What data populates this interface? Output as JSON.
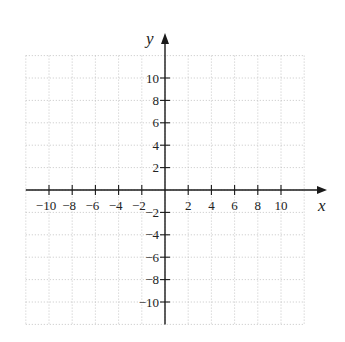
{
  "chart_data": {
    "type": "scatter",
    "title": "",
    "xlabel": "x",
    "ylabel": "y",
    "xlim": [
      -12,
      12
    ],
    "ylim": [
      -12,
      12
    ],
    "grid": true,
    "grid_step": 2,
    "grid_style": "dotted",
    "x_ticks": [
      -10,
      -8,
      -6,
      -4,
      -2,
      2,
      4,
      6,
      8,
      10
    ],
    "y_ticks": [
      10,
      8,
      6,
      4,
      2,
      -2,
      -4,
      -6,
      -8,
      -10
    ],
    "x_tick_labels": [
      "−10",
      "−8",
      "−6",
      "−4",
      "−2",
      "2",
      "4",
      "6",
      "8",
      "10"
    ],
    "y_tick_labels": [
      "10",
      "8",
      "6",
      "4",
      "2",
      "−2",
      "−4",
      "−6",
      "−8",
      "−10"
    ],
    "series": [],
    "legend": null
  },
  "colors": {
    "axis": "#1a1a1a",
    "grid": "#b8b8b8",
    "text": "#222222",
    "background": "#ffffff"
  }
}
